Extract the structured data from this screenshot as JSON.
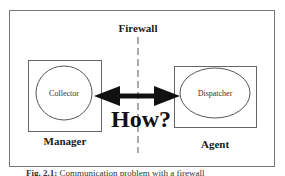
{
  "figure": {
    "firewall_label": "Firewall",
    "question_label": "How?",
    "left": {
      "box_label": "Manager",
      "node_label": "Collector"
    },
    "right": {
      "box_label": "Agent",
      "node_label": "Dispatcher"
    },
    "caption": {
      "prefix": "Fig. 2.1:",
      "text": "Communication problem with a firewall"
    },
    "colors": {
      "line": "#555555",
      "arrow": "#111111",
      "text": "#1a1a1a"
    }
  }
}
